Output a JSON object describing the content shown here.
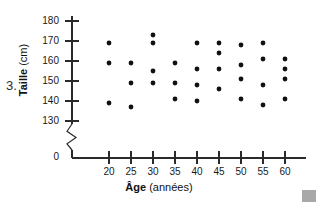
{
  "figure": {
    "question_number": "3.",
    "corner_mark": "gray-square-artifact"
  },
  "chart_data": {
    "type": "scatter",
    "title": "",
    "xlabel": "Âge",
    "xlabel_unit": "(années)",
    "ylabel": "Taille",
    "ylabel_unit": "(cm)",
    "xlim": [
      15,
      65
    ],
    "ylim": [
      125,
      185
    ],
    "y_axis_break": true,
    "y_origin_label": "0",
    "grid": false,
    "legend": "none",
    "xticks": [
      20,
      25,
      30,
      35,
      40,
      45,
      50,
      55,
      60
    ],
    "xtick_labels": [
      "20",
      "25",
      "30",
      "35",
      "40",
      "45",
      "50",
      "55",
      "60"
    ],
    "yticks": [
      130,
      140,
      150,
      160,
      170,
      180
    ],
    "ytick_labels": [
      "130",
      "140",
      "150",
      "160",
      "170",
      "180"
    ],
    "marker": "filled-circle",
    "marker_color": "#111111",
    "points": [
      {
        "x": 20,
        "y": 169
      },
      {
        "x": 20,
        "y": 159
      },
      {
        "x": 20,
        "y": 139
      },
      {
        "x": 25,
        "y": 159
      },
      {
        "x": 25,
        "y": 149
      },
      {
        "x": 25,
        "y": 137
      },
      {
        "x": 30,
        "y": 173
      },
      {
        "x": 30,
        "y": 169
      },
      {
        "x": 30,
        "y": 155
      },
      {
        "x": 30,
        "y": 149
      },
      {
        "x": 35,
        "y": 159
      },
      {
        "x": 35,
        "y": 149
      },
      {
        "x": 35,
        "y": 141
      },
      {
        "x": 40,
        "y": 169
      },
      {
        "x": 40,
        "y": 156
      },
      {
        "x": 40,
        "y": 148
      },
      {
        "x": 40,
        "y": 140
      },
      {
        "x": 45,
        "y": 169
      },
      {
        "x": 45,
        "y": 164
      },
      {
        "x": 45,
        "y": 156
      },
      {
        "x": 45,
        "y": 146
      },
      {
        "x": 50,
        "y": 168
      },
      {
        "x": 50,
        "y": 158
      },
      {
        "x": 50,
        "y": 151
      },
      {
        "x": 50,
        "y": 141
      },
      {
        "x": 55,
        "y": 169
      },
      {
        "x": 55,
        "y": 161
      },
      {
        "x": 55,
        "y": 148
      },
      {
        "x": 55,
        "y": 138
      },
      {
        "x": 60,
        "y": 161
      },
      {
        "x": 60,
        "y": 156
      },
      {
        "x": 60,
        "y": 151
      },
      {
        "x": 60,
        "y": 141
      }
    ]
  }
}
